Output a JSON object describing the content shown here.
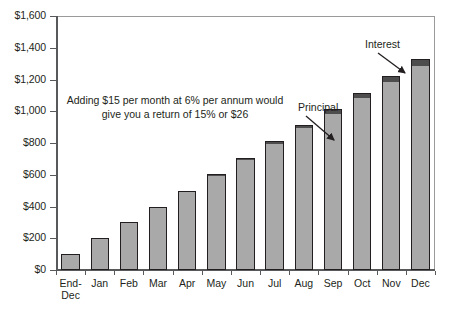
{
  "chart_data": {
    "type": "bar",
    "title": "",
    "subtitle": "",
    "xlabel": "",
    "ylabel": "",
    "ylim": [
      0,
      1600
    ],
    "grid": false,
    "legend_position": "none",
    "stacked": true,
    "categories": [
      "End-\nDec",
      "Jan",
      "Feb",
      "Mar",
      "Apr",
      "May",
      "Jun",
      "Jul",
      "Aug",
      "Sep",
      "Oct",
      "Nov",
      "Dec"
    ],
    "y_ticks": [
      0,
      200,
      400,
      600,
      800,
      1000,
      1200,
      1400,
      1600
    ],
    "y_tick_labels": [
      "$0",
      "$200",
      "$400",
      "$600",
      "$800",
      "$1,000",
      "$1,200",
      "$1,400",
      "$1,600"
    ],
    "series": [
      {
        "name": "Principal",
        "color": "#a9a9a9",
        "values": [
          100,
          200,
          300,
          400,
          500,
          600,
          700,
          800,
          900,
          990,
          1090,
          1190,
          1290
        ]
      },
      {
        "name": "Interest",
        "color": "#4d4d4d",
        "values": [
          0,
          0,
          0,
          0,
          0,
          5,
          8,
          12,
          16,
          22,
          28,
          35,
          42
        ]
      }
    ],
    "totals": [
      100,
      200,
      300,
      400,
      500,
      600,
      708,
      812,
      916,
      1012,
      1118,
      1225,
      1332
    ],
    "annotations": [
      {
        "name": "note",
        "text": "Adding $15 per month at 6% per annum would give you a return of 15% or $26"
      },
      {
        "name": "principal-callout",
        "text": "Principal",
        "points_to": "Sep"
      },
      {
        "name": "interest-callout",
        "text": "Interest",
        "points_to": "Dec"
      }
    ]
  },
  "colors": {
    "principal": "#a9a9a9",
    "interest": "#4d4d4d",
    "axis": "#58595b",
    "frame": "#9a9a9a",
    "text": "#231f20",
    "background": "#ffffff"
  }
}
